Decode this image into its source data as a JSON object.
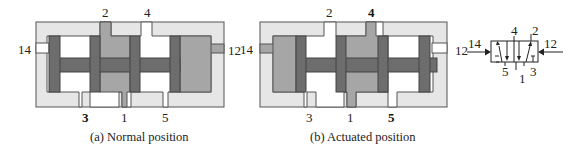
{
  "figure": {
    "panels": [
      {
        "id": "a",
        "caption": "(a) Normal position",
        "ports": {
          "p2": "2",
          "p4": "4",
          "p14": "14",
          "p12": "12",
          "p3": "3",
          "p1": "1",
          "p5": "5"
        },
        "bold_port": "3",
        "pressurized_pilot": "12"
      },
      {
        "id": "b",
        "caption": "(b) Actuated position",
        "ports": {
          "p2": "2",
          "p4": "4",
          "p14": "14",
          "p12": "12",
          "p3": "3",
          "p1": "1",
          "p5": "5"
        },
        "bold_port": "5",
        "pressurized_pilot": "14"
      }
    ],
    "symbol": {
      "ports": {
        "p4": "4",
        "p2": "2",
        "p14": "14",
        "p12": "12",
        "p5": "5",
        "p1": "1",
        "p3": "3"
      }
    },
    "colors": {
      "body": "#e6e6e6",
      "spool": "#6d6d6d",
      "pressurized": "#a6a6a6",
      "cavity": "#ffffff",
      "outline": "#555555"
    }
  }
}
